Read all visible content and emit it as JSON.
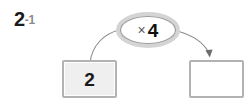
{
  "worksheet": {
    "exercise": {
      "number": "2",
      "subnumber": "-1"
    },
    "diagram": {
      "type": "function-machine",
      "operator_bubble": {
        "operator_symbol": "×",
        "operator_value": "4",
        "full_label": "× 4"
      },
      "input_box": {
        "value": "2",
        "filled": "true"
      },
      "output_box": {
        "value": "",
        "filled": "false"
      },
      "arrows": [
        {
          "name": "input-to-operator-arc",
          "has_arrowhead": "false",
          "direction": "up-right"
        },
        {
          "name": "operator-to-output-arc",
          "has_arrowhead": "true",
          "direction": "down-right"
        }
      ]
    },
    "colors": {
      "stroke_gray": "#8c8c8c",
      "box_border": "#b2b2b2",
      "box_fill_filled": "#efefef",
      "box_fill_empty": "#ffffff",
      "bubble_ring": "#cfcfcf",
      "bubble_inner_stroke": "#9a9a9a",
      "text_dark": "#1a1a1a",
      "text_muted": "#8c8c8c",
      "background": "#ffffff"
    }
  }
}
